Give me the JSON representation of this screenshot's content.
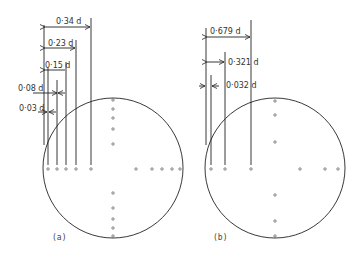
{
  "diagram": {
    "panel_a": {
      "caption": "(a)",
      "dimensions": [
        {
          "label": "0·34 d",
          "value": 0.34
        },
        {
          "label": "0·23 d",
          "value": 0.23
        },
        {
          "label": "0·15 d",
          "value": 0.15
        },
        {
          "label": "0·08 d",
          "value": 0.08
        },
        {
          "label": "0·03 d",
          "value": 0.03
        }
      ],
      "horizontal_holes": 10,
      "vertical_holes": 10
    },
    "panel_b": {
      "caption": "(b)",
      "dimensions": [
        {
          "label": "0·679 d",
          "value": 0.679
        },
        {
          "label": "0·321 d",
          "value": 0.321
        },
        {
          "label": "0·032 d",
          "value": 0.032
        }
      ],
      "horizontal_holes": 6,
      "vertical_holes": 6
    },
    "colors": {
      "line": "#222222",
      "dot": "#555555",
      "background": "#ffffff"
    }
  }
}
